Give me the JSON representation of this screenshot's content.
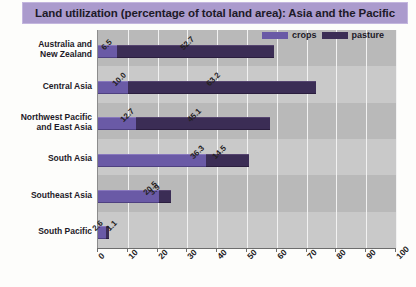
{
  "title": "Land utilization (percentage of total land area): Asia and the Pacific",
  "legend": {
    "crops_label": "crops",
    "pasture_label": "pasture"
  },
  "colors": {
    "crops": "#6a5aa6",
    "pasture": "#3b2d55",
    "title_band": "#ab9bcd",
    "plot_background": "#c9c9c9",
    "plot_band": "#b9b9b9",
    "gridline": "#f2f2f2"
  },
  "chart_data": {
    "type": "bar",
    "orientation": "horizontal",
    "stacked": true,
    "title": "Land utilization (percentage of total land area): Asia and the Pacific",
    "xlabel": "",
    "ylabel": "",
    "xlim": [
      0,
      100
    ],
    "xticks": [
      "0",
      "10",
      "20",
      "30",
      "40",
      "50",
      "60",
      "70",
      "80",
      "90",
      "100"
    ],
    "grid": true,
    "legend_position": "top-right",
    "categories": [
      "Australia and New Zealand",
      "Central Asia",
      "Northwest Pacific and East Asia",
      "South Asia",
      "Southeast Asia",
      "South Pacific"
    ],
    "series": [
      {
        "name": "crops",
        "values": [
          6.5,
          10.0,
          12.7,
          36.3,
          20.5,
          2.6
        ],
        "labels": [
          "6.5",
          "10.0",
          "12.7",
          "36.3",
          "20.5",
          "2.6"
        ]
      },
      {
        "name": "pasture",
        "values": [
          52.7,
          63.2,
          45.1,
          14.5,
          3.9,
          1.1
        ],
        "labels": [
          "52.7",
          "63.2",
          "45.1",
          "14.5",
          "3.9",
          "1.1"
        ]
      }
    ]
  },
  "category_lines": [
    [
      "Australia and",
      "New Zealand"
    ],
    [
      "Central Asia"
    ],
    [
      "Northwest Pacific",
      "and East Asia"
    ],
    [
      "South Asia"
    ],
    [
      "Southeast Asia"
    ],
    [
      "South Pacific"
    ]
  ]
}
